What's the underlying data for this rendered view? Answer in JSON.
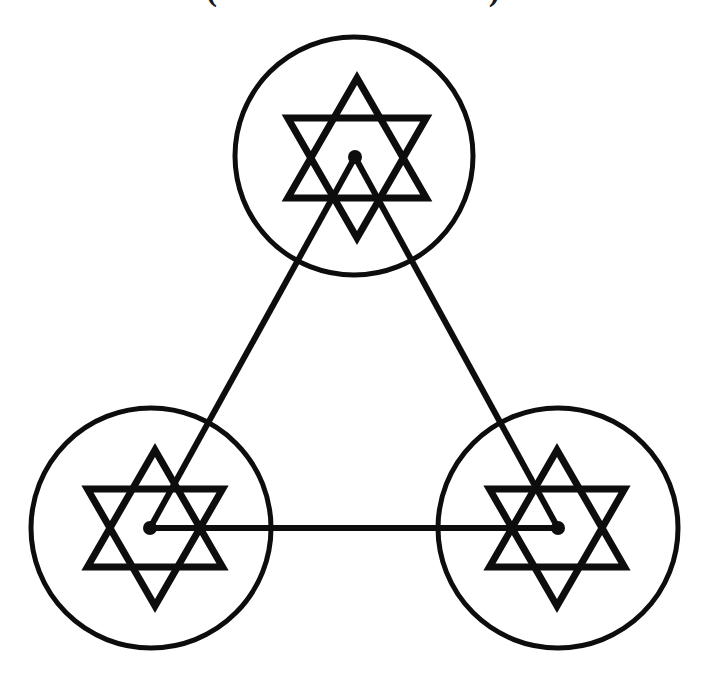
{
  "figure": {
    "background_color": "#ffffff",
    "ink_color": "#0d0d0d",
    "width": 709,
    "height": 690
  },
  "caption": {
    "text": "(PLATE XXXIII)",
    "note": "cropped at top edge; only glyph bottoms visible"
  },
  "chart_data": {
    "type": "diagram",
    "node_count": 3,
    "edge_count": 3,
    "stroke_width_circle": 5,
    "stroke_width_hexagram": 7,
    "stroke_width_link": 6,
    "dot_radius": 7,
    "nodes": [
      {
        "id": "top",
        "label": "top-node",
        "cx": 354,
        "cy": 156,
        "circle_radius": 119,
        "hexagram_radius": 80,
        "hexagram_cx": 357,
        "hexagram_cy": 158,
        "dot_cx": 355,
        "dot_cy": 157
      },
      {
        "id": "bottom-left",
        "label": "bottom-left-node",
        "cx": 151,
        "cy": 528,
        "circle_radius": 120,
        "hexagram_radius": 78,
        "hexagram_cx": 155,
        "hexagram_cy": 528,
        "dot_cx": 150,
        "dot_cy": 528
      },
      {
        "id": "bottom-right",
        "label": "bottom-right-node",
        "cx": 558,
        "cy": 528,
        "circle_radius": 120,
        "hexagram_radius": 78,
        "hexagram_cx": 557,
        "hexagram_cy": 528,
        "dot_cx": 558,
        "dot_cy": 528
      }
    ],
    "edges": [
      {
        "id": "edge-top-left",
        "from": "top",
        "to": "bottom-left",
        "x1": 355,
        "y1": 157,
        "x2": 150,
        "y2": 528
      },
      {
        "id": "edge-top-right",
        "from": "top",
        "to": "bottom-right",
        "x1": 355,
        "y1": 157,
        "x2": 558,
        "y2": 528
      },
      {
        "id": "edge-bottom",
        "from": "bottom-left",
        "to": "bottom-right",
        "x1": 150,
        "y1": 528,
        "x2": 558,
        "y2": 528
      }
    ]
  }
}
